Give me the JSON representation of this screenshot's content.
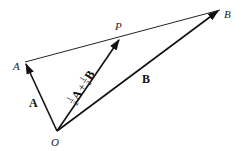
{
  "diagram": {
    "points": {
      "O": {
        "label": "O",
        "x": 57,
        "y": 131
      },
      "A": {
        "label": "A",
        "x": 25,
        "y": 62
      },
      "P": {
        "label": "P",
        "x": 120,
        "y": 38
      },
      "B": {
        "label": "B",
        "x": 220,
        "y": 10
      }
    },
    "vectors": {
      "a": {
        "label": "A",
        "from": "O",
        "to": "A"
      },
      "b": {
        "label": "B",
        "from": "O",
        "to": "B"
      },
      "p": {
        "label": "½A + ½B",
        "from": "O",
        "to": "P",
        "parts": {
          "half1": "1",
          "den1": "2",
          "A": "A",
          "plus": "+",
          "half2": "1",
          "den2": "2",
          "B": "B"
        }
      }
    },
    "segments": [
      {
        "from": "A",
        "to": "B"
      }
    ]
  }
}
